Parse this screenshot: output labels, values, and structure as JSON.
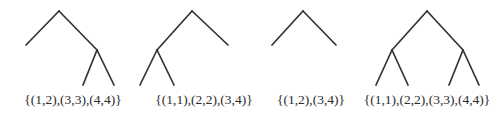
{
  "figure": {
    "kind": "binary-tree-diagram-row",
    "background_color": "#ffffff",
    "stroke_color": "#333333",
    "stroke_width": 1.7,
    "text_color": "#2b2b2b",
    "width": 502,
    "height": 121
  },
  "trees": [
    {
      "id": "tree-1",
      "label": "{(1,2),(3,3),(4,4)}",
      "description": "root with left leaf and right internal node having two leaves",
      "nodes": {
        "root": [
          59,
          11
        ],
        "left_leaf": [
          26,
          45
        ],
        "right_internal": [
          97,
          50
        ],
        "right_left_leaf": [
          83,
          85
        ],
        "right_right_leaf": [
          114,
          85
        ]
      },
      "edges": [
        [
          59,
          11,
          26,
          45
        ],
        [
          59,
          11,
          97,
          50
        ],
        [
          97,
          50,
          83,
          85
        ],
        [
          97,
          50,
          114,
          85
        ]
      ]
    },
    {
      "id": "tree-2",
      "label": "{(1,1),(2,2),(3,4)}",
      "description": "root with left internal node having two leaves and a right leaf",
      "nodes": {
        "root": [
          192,
          11
        ],
        "left_internal": [
          157,
          50
        ],
        "left_left_leaf": [
          140,
          85
        ],
        "left_right_leaf": [
          174,
          85
        ],
        "right_leaf": [
          228,
          45
        ]
      },
      "edges": [
        [
          192,
          11,
          157,
          50
        ],
        [
          157,
          50,
          140,
          85
        ],
        [
          157,
          50,
          174,
          85
        ],
        [
          192,
          11,
          228,
          45
        ]
      ]
    },
    {
      "id": "tree-3",
      "label": "{(1,2),(3,4)}",
      "description": "root with two leaves",
      "nodes": {
        "root": [
          303,
          11
        ],
        "left_leaf": [
          272,
          45
        ],
        "right_leaf": [
          336,
          45
        ]
      },
      "edges": [
        [
          303,
          11,
          272,
          45
        ],
        [
          303,
          11,
          336,
          45
        ]
      ]
    },
    {
      "id": "tree-4",
      "label": "{(1,1),(2,2),(3,3),(4,4)}",
      "description": "complete binary tree of depth two with four leaves",
      "nodes": {
        "root": [
          427,
          11
        ],
        "left_internal": [
          392,
          50
        ],
        "left_left_leaf": [
          376,
          85
        ],
        "left_right_leaf": [
          408,
          85
        ],
        "right_internal": [
          463,
          50
        ],
        "right_left_leaf": [
          449,
          85
        ],
        "right_right_leaf": [
          479,
          85
        ]
      },
      "edges": [
        [
          427,
          11,
          392,
          50
        ],
        [
          392,
          50,
          376,
          85
        ],
        [
          392,
          50,
          408,
          85
        ],
        [
          427,
          11,
          463,
          50
        ],
        [
          463,
          50,
          449,
          85
        ],
        [
          463,
          50,
          479,
          85
        ]
      ]
    }
  ]
}
